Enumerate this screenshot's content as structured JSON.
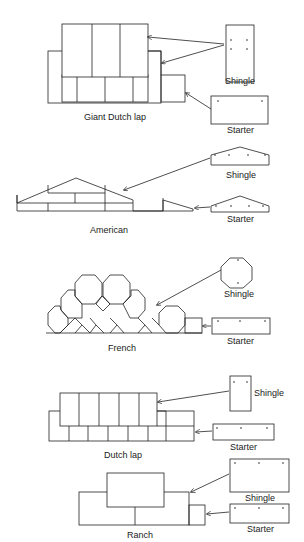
{
  "diagram": {
    "sections": [
      {
        "name": "Giant Dutch lap",
        "shingle_label": "Shingle",
        "starter_label": "Starter"
      },
      {
        "name": "American",
        "shingle_label": "Shingle",
        "starter_label": "Starter"
      },
      {
        "name": "French",
        "shingle_label": "Shingle",
        "starter_label": "Starter"
      },
      {
        "name": "Dutch lap",
        "shingle_label": "Shingle",
        "starter_label": "Starter"
      },
      {
        "name": "Ranch",
        "shingle_label": "Shingle",
        "starter_label": "Starter"
      }
    ],
    "line_color": "#222222"
  }
}
